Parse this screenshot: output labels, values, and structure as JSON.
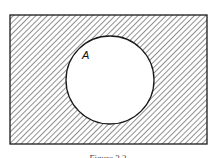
{
  "diagram": {
    "type": "venn",
    "universe": {
      "x": 10,
      "y": 15,
      "width": 197,
      "height": 129,
      "shaded": true
    },
    "sets": [
      {
        "label": "A",
        "cx": 110,
        "cy": 80,
        "r": 44,
        "shaded": false
      }
    ],
    "caption": "Figure 3.2",
    "colors": {
      "stroke": "#1a1a1a",
      "hatch": "#333333",
      "background": "#ffffff"
    }
  }
}
